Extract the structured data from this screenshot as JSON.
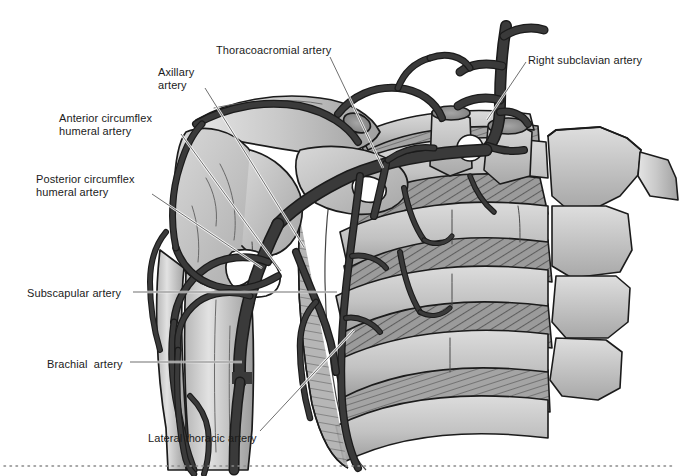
{
  "figure": {
    "type": "anatomical-illustration",
    "background_color": "#ffffff",
    "line_color": "#1f1f1f",
    "palette": {
      "bone_light": "#cfcfcf",
      "bone_mid": "#b4b4b4",
      "bone_shadow": "#949494",
      "muscle_mid": "#9a9a9a",
      "muscle_dark": "#777777",
      "artery_dark": "#3a3a3a",
      "artery_fill": "#444444",
      "outline": "#1b1b1b",
      "leader_light": "#e8e8e8",
      "text": "#1b1b1b"
    },
    "bottom_rule": {
      "style": "dotted",
      "color": "#8a8a8a",
      "y": 466
    }
  },
  "labels": [
    {
      "id": "thoracoacromial",
      "text": "Thoracoacromial artery",
      "x": 216,
      "y": 44,
      "align": "l",
      "leader": [
        [
          330,
          57
        ],
        [
          383,
          168
        ]
      ]
    },
    {
      "id": "right-subclavian",
      "text": "Right subclavian artery",
      "x": 528,
      "y": 54,
      "align": "l",
      "leader": [
        [
          526,
          62
        ],
        [
          487,
          120
        ]
      ]
    },
    {
      "id": "axillary",
      "text": "Axillary\nartery",
      "x": 158,
      "y": 66,
      "align": "l",
      "leader": [
        [
          205,
          88
        ],
        [
          304,
          247
        ]
      ]
    },
    {
      "id": "anterior-circumflex",
      "text": "Anterior circumflex\nhumeral artery",
      "x": 59,
      "y": 112,
      "align": "l",
      "leader": [
        [
          181,
          134
        ],
        [
          281,
          271
        ]
      ]
    },
    {
      "id": "posterior-circumflex",
      "text": "Posterior circumflex\nhumeral artery",
      "x": 36,
      "y": 173,
      "align": "l",
      "leader": [
        [
          152,
          194
        ],
        [
          262,
          268
        ]
      ]
    },
    {
      "id": "subscapular",
      "text": "Subscapular artery",
      "x": 27,
      "y": 287,
      "align": "l",
      "leader": [
        [
          133,
          292
        ],
        [
          337,
          292
        ]
      ]
    },
    {
      "id": "brachial",
      "text": "Brachial  artery",
      "x": 47,
      "y": 358,
      "align": "l",
      "leader": [
        [
          130,
          362
        ],
        [
          242,
          362
        ]
      ]
    },
    {
      "id": "lateral-thoracic",
      "text": "Lateral thoracic artery",
      "x": 148,
      "y": 432,
      "align": "l",
      "leader": [
        [
          260,
          431
        ],
        [
          354,
          330
        ]
      ]
    }
  ]
}
